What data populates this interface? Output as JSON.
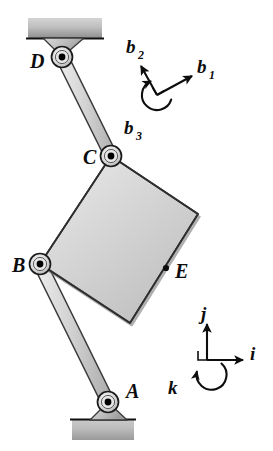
{
  "figure": {
    "background_color": "#ffffff",
    "ink_color": "#0d0d0d",
    "body_fill_light": "#e0e0e0",
    "body_fill_mid": "#c9c9c9",
    "body_fill_dark": "#a8a8a8",
    "joint_pin_color": "#000000"
  },
  "joints": [
    {
      "id": "A",
      "label": "A",
      "x": 108,
      "y": 402,
      "label_x": 126,
      "label_y": 398,
      "kind": "ground-pin-joint"
    },
    {
      "id": "B",
      "label": "B",
      "x": 40,
      "y": 264,
      "label_x": 14,
      "label_y": 270,
      "kind": "pin-joint"
    },
    {
      "id": "C",
      "label": "C",
      "x": 111,
      "y": 156,
      "label_x": 84,
      "label_y": 163,
      "kind": "pin-joint"
    },
    {
      "id": "D",
      "label": "D",
      "x": 62,
      "y": 57,
      "label_x": 32,
      "label_y": 66,
      "kind": "ground-pin-joint"
    }
  ],
  "points": [
    {
      "id": "E",
      "label": "E",
      "x": 166,
      "y": 268,
      "label_x": 176,
      "label_y": 277,
      "kind": "marked-point"
    }
  ],
  "links": [
    {
      "id": "DC",
      "label": "link-D-C",
      "from": "D",
      "to": "C",
      "width": 13
    },
    {
      "id": "BA",
      "label": "link-B-A",
      "from": "B",
      "to": "A",
      "width": 13
    }
  ],
  "plate": {
    "id": "plate-BCE",
    "label": "rigid-plate",
    "vertices": [
      [
        111,
        156
      ],
      [
        198,
        214
      ],
      [
        130,
        323
      ],
      [
        40,
        264
      ]
    ]
  },
  "grounds": [
    {
      "id": "ground-top",
      "x": 28,
      "y": 18,
      "width": 74,
      "height": 20,
      "hatch": "solid-shaded"
    },
    {
      "id": "ground-bottom",
      "x": 72,
      "y": 420,
      "width": 62,
      "height": 20,
      "hatch": "solid-shaded"
    }
  ],
  "brackets": [
    {
      "id": "bracket-D",
      "joint": "D",
      "base_y": 38,
      "left_x": 40,
      "right_x": 90
    },
    {
      "id": "bracket-A",
      "joint": "A",
      "base_y": 420,
      "left_x": 86,
      "right_x": 132
    }
  ],
  "triads": [
    {
      "id": "b-frame",
      "name": "body-frame-triad",
      "origin_x": 157,
      "origin_y": 95,
      "arc_radius": 15,
      "vectors": [
        {
          "id": "b1",
          "base": "b",
          "sub": "1",
          "label": "b₁",
          "tip_x": 192,
          "tip_y": 76,
          "label_x": 200,
          "label_y": 68,
          "sub_x": 214,
          "sub_y": 74
        },
        {
          "id": "b2",
          "base": "b",
          "sub": "2",
          "label": "b₂",
          "tip_x": 141,
          "tip_y": 66,
          "label_x": 128,
          "label_y": 52,
          "sub_x": 141,
          "sub_y": 58
        },
        {
          "id": "b3",
          "base": "b",
          "sub": "3",
          "label": "b₃",
          "tip_x": 141,
          "tip_y": 116,
          "label_x": 127,
          "label_y": 133,
          "sub_x": 140,
          "sub_y": 139
        }
      ]
    },
    {
      "id": "ijk-frame",
      "name": "inertial-frame-triad",
      "origin_x": 207,
      "origin_y": 360,
      "arc_radius": 15,
      "vectors": [
        {
          "id": "i",
          "base": "i",
          "sub": "",
          "label": "i",
          "tip_x": 243,
          "tip_y": 360,
          "label_x": 252,
          "label_y": 356,
          "sub_x": 0,
          "sub_y": 0
        },
        {
          "id": "j",
          "base": "j",
          "sub": "",
          "label": "j",
          "tip_x": 207,
          "tip_y": 324,
          "label_x": 202,
          "label_y": 316,
          "sub_x": 0,
          "sub_y": 0
        },
        {
          "id": "k",
          "base": "k",
          "sub": "",
          "label": "k",
          "tip_x": 184,
          "tip_y": 382,
          "label_x": 170,
          "label_y": 390,
          "sub_x": 0,
          "sub_y": 0
        }
      ]
    }
  ]
}
